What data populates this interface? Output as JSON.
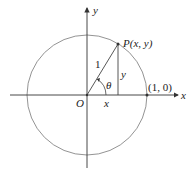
{
  "diagram": {
    "type": "unit-circle",
    "colors": {
      "stroke": "#555555",
      "text": "#222222",
      "background": "#ffffff"
    },
    "labels": {
      "y_axis": "y",
      "x_axis": "x",
      "origin": "O",
      "point_p": "P(x, y)",
      "radius": "1",
      "angle": "θ",
      "x_leg": "x",
      "y_leg": "y",
      "point_on_axis": "(1, 0)"
    }
  }
}
